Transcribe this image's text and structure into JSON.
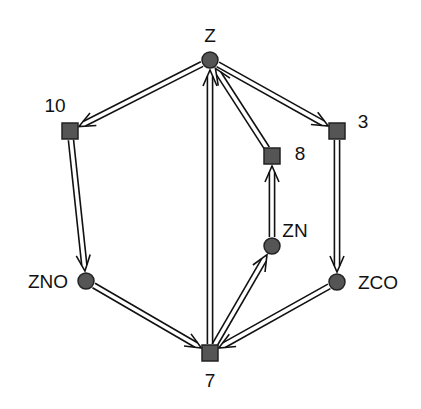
{
  "diagram": {
    "colors": {
      "node_fill": "#555555",
      "node_stroke": "#222222",
      "edge": "#111111",
      "background": "#ffffff"
    },
    "nodes": [
      {
        "id": "Z",
        "label": "Z",
        "shape": "circle",
        "x": 210,
        "y": 60,
        "lx": 210,
        "ly": 42,
        "anchor": "middle"
      },
      {
        "id": "10",
        "label": "10",
        "shape": "square",
        "x": 70,
        "y": 131,
        "lx": 55,
        "ly": 112,
        "anchor": "middle"
      },
      {
        "id": "3",
        "label": "3",
        "shape": "square",
        "x": 337,
        "y": 131,
        "lx": 363,
        "ly": 128,
        "anchor": "middle"
      },
      {
        "id": "8",
        "label": "8",
        "shape": "square",
        "x": 272,
        "y": 156,
        "lx": 300,
        "ly": 160,
        "anchor": "middle"
      },
      {
        "id": "ZN",
        "label": "ZN",
        "shape": "circle",
        "x": 272,
        "y": 246,
        "lx": 295,
        "ly": 237,
        "anchor": "middle"
      },
      {
        "id": "ZNO",
        "label": "ZNO",
        "shape": "circle",
        "x": 86,
        "y": 281,
        "lx": 48,
        "ly": 288,
        "anchor": "middle"
      },
      {
        "id": "ZCO",
        "label": "ZCO",
        "shape": "circle",
        "x": 337,
        "y": 282,
        "lx": 378,
        "ly": 289,
        "anchor": "middle"
      },
      {
        "id": "7",
        "label": "7",
        "shape": "square",
        "x": 210,
        "y": 353,
        "lx": 210,
        "ly": 387,
        "anchor": "middle"
      }
    ],
    "edges": [
      {
        "from": "Z",
        "to": "10"
      },
      {
        "from": "Z",
        "to": "3"
      },
      {
        "from": "10",
        "to": "ZNO"
      },
      {
        "from": "3",
        "to": "ZCO"
      },
      {
        "from": "ZNO",
        "to": "7"
      },
      {
        "from": "ZCO",
        "to": "7"
      },
      {
        "from": "7",
        "to": "Z"
      },
      {
        "from": "7",
        "to": "ZN"
      },
      {
        "from": "ZN",
        "to": "8"
      },
      {
        "from": "8",
        "to": "Z"
      }
    ]
  }
}
